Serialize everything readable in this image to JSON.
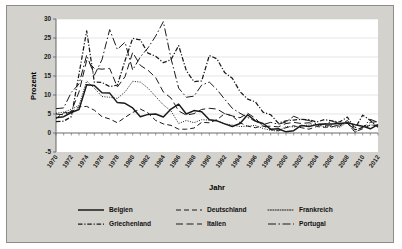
{
  "chart_data": {
    "type": "line",
    "title": "",
    "xlabel": "Jahr",
    "ylabel": "Prozent",
    "xlim": [
      1970,
      2012
    ],
    "ylim": [
      -5,
      30
    ],
    "yticks": [
      -5,
      0,
      5,
      10,
      15,
      20,
      25,
      30
    ],
    "xticks": [
      1970,
      1972,
      1974,
      1976,
      1978,
      1980,
      1982,
      1984,
      1986,
      1988,
      1990,
      1992,
      1994,
      1996,
      1998,
      2000,
      2002,
      2004,
      2006,
      2008,
      2010,
      2012
    ],
    "grid": "horizontal",
    "legend_position": "bottom",
    "x": [
      1970,
      1971,
      1972,
      1973,
      1974,
      1975,
      1976,
      1977,
      1978,
      1979,
      1980,
      1981,
      1982,
      1983,
      1984,
      1985,
      1986,
      1987,
      1988,
      1989,
      1990,
      1991,
      1992,
      1993,
      1994,
      1995,
      1996,
      1997,
      1998,
      1999,
      2000,
      2001,
      2002,
      2003,
      2004,
      2005,
      2006,
      2007,
      2008,
      2009,
      2010,
      2011,
      2012
    ],
    "series": [
      {
        "name": "Belgien",
        "style": "solid",
        "values": [
          4.0,
          4.3,
          5.4,
          6.2,
          12.7,
          12.5,
          10.6,
          10.5,
          8.0,
          7.8,
          6.6,
          4.3,
          4.9,
          5.0,
          4.2,
          6.3,
          7.6,
          5.0,
          5.9,
          5.6,
          3.5,
          3.2,
          2.4,
          1.7,
          2.5,
          4.8,
          3.2,
          2.5,
          1.0,
          1.1,
          0.3,
          0.6,
          2.0,
          1.7,
          2.2,
          2.4,
          2.4,
          2.5,
          2.7,
          2.2,
          1.8,
          1.1,
          2.2
        ]
      },
      {
        "name": "Deutschland",
        "style": "dashed",
        "values": [
          3.8,
          5.3,
          5.5,
          6.9,
          7.0,
          6.0,
          4.3,
          3.7,
          2.7,
          4.1,
          5.4,
          6.3,
          5.3,
          3.3,
          2.4,
          2.0,
          1.0,
          1.0,
          1.3,
          2.8,
          2.7,
          3.5,
          5.1,
          4.5,
          2.7,
          1.8,
          1.4,
          1.9,
          0.9,
          0.6,
          1.4,
          1.9,
          1.4,
          1.0,
          1.7,
          1.5,
          1.6,
          2.3,
          2.6,
          0.3,
          1.1,
          2.1,
          2.0
        ]
      },
      {
        "name": "Frankreich",
        "style": "dotted",
        "values": [
          5.2,
          5.5,
          6.2,
          7.3,
          13.7,
          11.8,
          9.6,
          9.4,
          9.1,
          10.8,
          13.6,
          13.4,
          11.8,
          9.6,
          7.4,
          5.8,
          2.5,
          3.3,
          2.7,
          3.5,
          3.4,
          3.2,
          2.4,
          2.1,
          1.7,
          1.8,
          2.0,
          1.2,
          0.7,
          0.5,
          1.7,
          1.6,
          1.9,
          2.1,
          2.1,
          1.7,
          1.7,
          1.5,
          2.8,
          0.1,
          1.5,
          2.1,
          2.0
        ]
      },
      {
        "name": "Griechenland",
        "style": "dashdot",
        "values": [
          3.0,
          3.1,
          4.3,
          15.5,
          26.9,
          13.4,
          13.3,
          12.2,
          12.6,
          19.0,
          24.9,
          24.5,
          21.0,
          20.2,
          18.5,
          19.3,
          23.0,
          16.4,
          13.5,
          13.7,
          20.4,
          19.5,
          15.9,
          14.4,
          10.9,
          8.9,
          8.2,
          5.5,
          4.8,
          2.6,
          3.2,
          3.4,
          3.6,
          3.5,
          2.9,
          3.5,
          3.2,
          2.9,
          4.2,
          1.2,
          4.7,
          3.3,
          1.5
        ]
      },
      {
        "name": "Italien",
        "style": "longdash",
        "values": [
          5.0,
          4.8,
          5.7,
          10.8,
          19.1,
          17.0,
          16.8,
          17.0,
          12.1,
          14.8,
          21.2,
          17.8,
          16.5,
          14.6,
          10.8,
          9.2,
          5.8,
          4.7,
          5.1,
          6.2,
          6.5,
          6.3,
          5.1,
          4.5,
          4.0,
          5.2,
          3.9,
          1.7,
          1.8,
          1.6,
          2.5,
          2.8,
          2.5,
          2.7,
          2.2,
          2.0,
          2.1,
          1.8,
          3.3,
          0.8,
          1.5,
          2.8,
          3.0
        ]
      },
      {
        "name": "Portugal",
        "style": "longdashdot",
        "values": [
          6.4,
          6.6,
          10.7,
          12.9,
          20.5,
          15.2,
          19.3,
          27.2,
          22.0,
          23.9,
          16.6,
          20.0,
          22.4,
          25.5,
          29.3,
          19.6,
          11.8,
          9.4,
          9.7,
          12.6,
          13.4,
          11.4,
          8.9,
          6.5,
          5.2,
          4.1,
          3.1,
          2.2,
          2.8,
          2.3,
          2.9,
          4.4,
          3.6,
          3.3,
          2.4,
          2.3,
          3.1,
          2.5,
          2.6,
          0.9,
          1.4,
          3.6,
          2.8
        ]
      }
    ]
  },
  "legend": {
    "items": [
      {
        "label": "Belgien",
        "style": "solid"
      },
      {
        "label": "Deutschland",
        "style": "dashed"
      },
      {
        "label": "Frankreich",
        "style": "dotted"
      },
      {
        "label": "Griechenland",
        "style": "dashdot"
      },
      {
        "label": "Italien",
        "style": "longdash"
      },
      {
        "label": "Portugal",
        "style": "longdashdot"
      }
    ]
  },
  "colors": {
    "plate": "#d4d2cd",
    "plot_background": "#ffffff",
    "line": "#1a1a1a",
    "grid": "#c8c8c8",
    "axis": "#5a5a5a"
  }
}
